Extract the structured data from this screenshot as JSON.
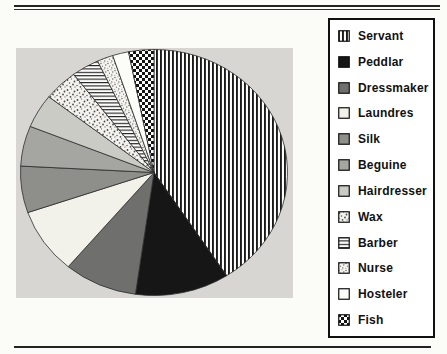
{
  "page": {
    "background_color": "#fbfbf8",
    "plot_background_color": "#d7d6d2",
    "rule_color": "#232323",
    "legend_border_color": "#101010"
  },
  "chart_data": {
    "type": "pie",
    "title": "",
    "legend_position": "right",
    "start_angle_deg": 0,
    "direction": "clockwise",
    "slices": [
      {
        "label": "Servant",
        "percent": 40.8,
        "angle_deg": 147,
        "pattern": "vertical-stripes",
        "color": "#fdfdfc"
      },
      {
        "label": "Peddlar",
        "percent": 11.4,
        "angle_deg": 41,
        "pattern": "solid",
        "color": "#161616"
      },
      {
        "label": "Dressmaker",
        "percent": 8.9,
        "angle_deg": 32,
        "pattern": "solid",
        "color": "#6f6f6d"
      },
      {
        "label": "Laundres",
        "percent": 8.6,
        "angle_deg": 31,
        "pattern": "solid",
        "color": "#f2f1ea"
      },
      {
        "label": "Silk",
        "percent": 6.1,
        "angle_deg": 22,
        "pattern": "solid",
        "color": "#8e8e8b"
      },
      {
        "label": "Beguine",
        "percent": 5.3,
        "angle_deg": 19,
        "pattern": "solid",
        "color": "#a5a5a1"
      },
      {
        "label": "Hairdresser",
        "percent": 4.4,
        "angle_deg": 16,
        "pattern": "solid",
        "color": "#cbcbc6"
      },
      {
        "label": "Wax",
        "percent": 4.2,
        "angle_deg": 15,
        "pattern": "stipple-coarse",
        "color": "#fdfdfc"
      },
      {
        "label": "Barber",
        "percent": 3.3,
        "angle_deg": 12,
        "pattern": "horizontal-lines",
        "color": "#fdfdfc"
      },
      {
        "label": "Nurse",
        "percent": 1.9,
        "angle_deg": 7,
        "pattern": "stipple-dense",
        "color": "#fdfdfc"
      },
      {
        "label": "Hosteler",
        "percent": 1.9,
        "angle_deg": 7,
        "pattern": "solid",
        "color": "#fcfcf9"
      },
      {
        "label": "Fish",
        "percent": 3.1,
        "angle_deg": 11,
        "pattern": "checkerboard",
        "color": "#fdfdfc"
      }
    ]
  }
}
